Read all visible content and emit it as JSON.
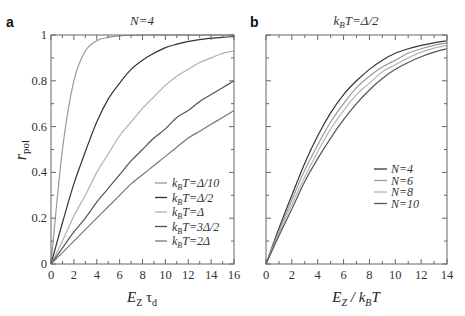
{
  "chart_data": [
    {
      "panel": "a",
      "type": "line",
      "title": "N=4",
      "xlabel": "E_Z τ_d",
      "ylabel": "r_pol",
      "xlim": [
        0,
        16
      ],
      "ylim": [
        0,
        1
      ],
      "xticks": [
        0,
        2,
        4,
        6,
        8,
        10,
        12,
        14,
        16
      ],
      "yticks": [
        0,
        0.2,
        0.4,
        0.6,
        0.8,
        1
      ],
      "ytick_labels": [
        "0",
        "0.2",
        "0.4",
        "0.6",
        "0.8",
        "1"
      ],
      "grid": false,
      "legend_position": "lower right",
      "x": [
        0,
        1,
        2,
        3,
        4,
        5,
        6,
        7,
        8,
        9,
        10,
        11,
        12,
        13,
        14,
        15,
        16
      ],
      "series": [
        {
          "name": "k_B T=Δ/10",
          "color": "#9a9a9a",
          "values": [
            0,
            0.5,
            0.8,
            0.93,
            0.975,
            0.99,
            0.996,
            0.999,
            1,
            1,
            1,
            1,
            1,
            1,
            1,
            1,
            1
          ]
        },
        {
          "name": "k_B T=Δ/2",
          "color": "#333333",
          "values": [
            0,
            0.18,
            0.35,
            0.49,
            0.62,
            0.72,
            0.79,
            0.85,
            0.89,
            0.92,
            0.945,
            0.96,
            0.972,
            0.98,
            0.986,
            0.99,
            0.993
          ]
        },
        {
          "name": "k_B T=Δ",
          "color": "#b0b0b0",
          "values": [
            0,
            0.1,
            0.21,
            0.3,
            0.4,
            0.48,
            0.56,
            0.62,
            0.68,
            0.73,
            0.78,
            0.82,
            0.85,
            0.88,
            0.9,
            0.92,
            0.93
          ]
        },
        {
          "name": "k_B T=3Δ/2",
          "color": "#555555",
          "values": [
            0,
            0.07,
            0.14,
            0.2,
            0.27,
            0.33,
            0.39,
            0.45,
            0.5,
            0.55,
            0.59,
            0.64,
            0.67,
            0.71,
            0.74,
            0.77,
            0.8
          ]
        },
        {
          "name": "k_B T=2Δ",
          "color": "#777777",
          "values": [
            0,
            0.05,
            0.1,
            0.15,
            0.2,
            0.25,
            0.3,
            0.35,
            0.39,
            0.43,
            0.47,
            0.51,
            0.55,
            0.58,
            0.61,
            0.64,
            0.67
          ]
        }
      ]
    },
    {
      "panel": "b",
      "type": "line",
      "title": "k_B T=Δ/2",
      "xlabel": "E_Z / k_B T",
      "ylabel": "",
      "xlim": [
        0,
        14
      ],
      "ylim": [
        0,
        1
      ],
      "xticks": [
        0,
        2,
        4,
        6,
        8,
        10,
        12,
        14
      ],
      "yticks": [
        0,
        0.2,
        0.4,
        0.6,
        0.8,
        1
      ],
      "grid": false,
      "legend_position": "center right",
      "x": [
        0,
        1,
        2,
        3,
        4,
        5,
        6,
        7,
        8,
        9,
        10,
        11,
        12,
        13,
        14
      ],
      "series": [
        {
          "name": "N=4",
          "color": "#333333",
          "values": [
            0,
            0.155,
            0.3,
            0.44,
            0.56,
            0.66,
            0.74,
            0.8,
            0.85,
            0.89,
            0.92,
            0.94,
            0.955,
            0.966,
            0.975
          ]
        },
        {
          "name": "N=6",
          "color": "#999999",
          "values": [
            0,
            0.143,
            0.28,
            0.41,
            0.52,
            0.62,
            0.7,
            0.77,
            0.82,
            0.86,
            0.89,
            0.92,
            0.94,
            0.955,
            0.965
          ]
        },
        {
          "name": "N=8",
          "color": "#b5b5b5",
          "values": [
            0,
            0.133,
            0.26,
            0.38,
            0.49,
            0.59,
            0.67,
            0.74,
            0.79,
            0.84,
            0.87,
            0.9,
            0.925,
            0.943,
            0.955
          ]
        },
        {
          "name": "N=10",
          "color": "#555555",
          "values": [
            0,
            0.123,
            0.24,
            0.36,
            0.46,
            0.55,
            0.63,
            0.7,
            0.76,
            0.81,
            0.85,
            0.88,
            0.905,
            0.925,
            0.94
          ]
        }
      ]
    }
  ],
  "labels": {
    "panel_a_letter": "a",
    "panel_b_letter": "b",
    "panel_a_title": "N=4",
    "panel_b_title_k": "k",
    "panel_b_title_sub": "B",
    "panel_b_title_rest": "T=Δ/2",
    "ylabel_main": "r",
    "ylabel_sub": "pol",
    "xlabel_a_main": "E",
    "xlabel_a_sub": "Z",
    "xlabel_a_rest": " τ",
    "xlabel_a_sub2": "d",
    "xlabel_b_main": "E",
    "xlabel_b_sub": "Z",
    "xlabel_b_mid": " / k",
    "xlabel_b_sub2": "B",
    "xlabel_b_rest": "T"
  },
  "legend_a": [
    {
      "pre": "k",
      "sub": "B",
      "post": "T=Δ/10"
    },
    {
      "pre": "k",
      "sub": "B",
      "post": "T=Δ/2"
    },
    {
      "pre": "k",
      "sub": "B",
      "post": "T=Δ"
    },
    {
      "pre": "k",
      "sub": "B",
      "post": "T=3Δ/2"
    },
    {
      "pre": "k",
      "sub": "B",
      "post": "T=2Δ"
    }
  ],
  "legend_b": [
    "N=4",
    "N=6",
    "N=8",
    "N=10"
  ]
}
